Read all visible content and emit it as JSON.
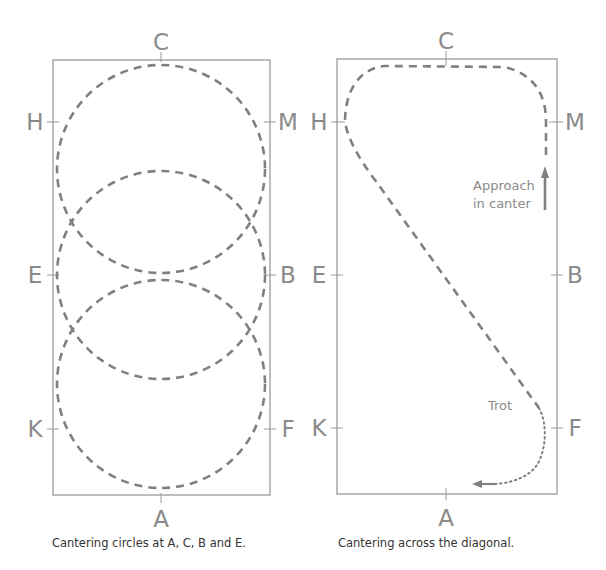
{
  "diagrams": [
    {
      "id": "circles",
      "caption": "Cantering circles at A, C, B and E.",
      "markers": {
        "C": "C",
        "H": "H",
        "M": "M",
        "E": "E",
        "B": "B",
        "K": "K",
        "F": "F",
        "A": "A"
      },
      "circles": [
        {
          "name": "circle-at-C",
          "cx": 161,
          "cy": 169,
          "r": 104
        },
        {
          "name": "circle-at-E-B",
          "cx": 161,
          "cy": 275,
          "r": 104
        },
        {
          "name": "circle-at-A",
          "cx": 161,
          "cy": 384,
          "r": 104
        }
      ]
    },
    {
      "id": "diagonal",
      "caption": "Cantering across the diagonal.",
      "markers": {
        "C": "C",
        "H": "H",
        "M": "M",
        "E": "E",
        "B": "B",
        "K": "K",
        "F": "F",
        "A": "A"
      },
      "notes": {
        "approach_line1": "Approach",
        "approach_line2": "in canter",
        "trot": "Trot"
      }
    }
  ],
  "colors": {
    "arena_border": "#9a9a9a",
    "path": "#808080",
    "letters": "#8a8a8a",
    "caption": "#333333"
  }
}
